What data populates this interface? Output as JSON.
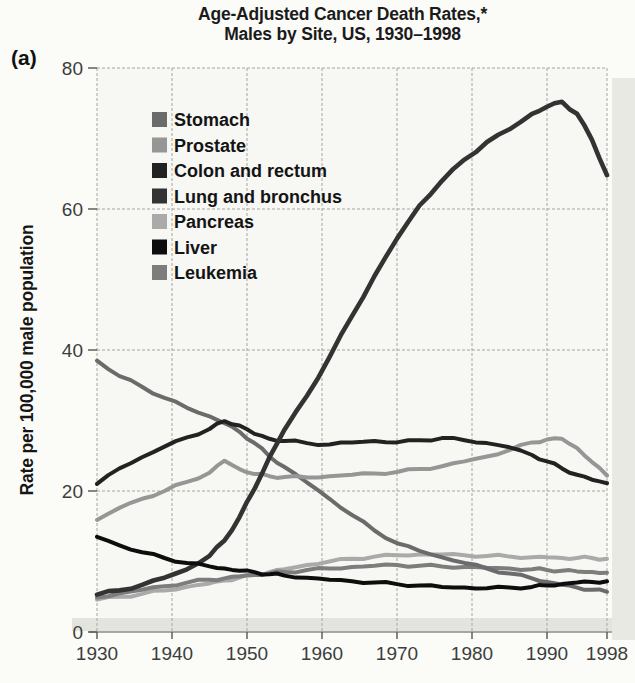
{
  "figure": {
    "panel_label": "(a)",
    "title_line1": "Age-Adjusted Cancer Death Rates,*",
    "title_line2": "Males by Site, US, 1930–1998",
    "y_axis_label": "Rate per 100,000 male population"
  },
  "colors": {
    "paper": "#fbfbf8",
    "plot_background": "#f7f7f3",
    "gridline": "#a5a5a0",
    "axis": "#555550",
    "tick_text": "#3d3d3d",
    "scan_shadow": "#e4e4df",
    "page_edge_band": "#e9e9e4"
  },
  "chart_data": {
    "type": "line",
    "title": "Age-Adjusted Cancer Death Rates,* Males by Site, US, 1930–1998",
    "xlabel": "",
    "ylabel": "Rate per 100,000 male population",
    "xlim": [
      1930,
      1998
    ],
    "ylim": [
      0,
      80
    ],
    "x_ticks": [
      1930,
      1940,
      1950,
      1960,
      1970,
      1980,
      1990,
      1998
    ],
    "x_tick_labels": [
      "1930",
      "1940",
      "1950",
      "1960",
      "1970",
      "1980",
      "1990",
      "1998"
    ],
    "y_ticks": [
      0,
      20,
      40,
      60,
      80
    ],
    "grid": true,
    "legend_position": "upper-left-inside",
    "x": [
      1930,
      1933,
      1936,
      1939,
      1942,
      1945,
      1947,
      1949,
      1951,
      1953,
      1955,
      1958,
      1961,
      1964,
      1967,
      1970,
      1973,
      1976,
      1979,
      1982,
      1985,
      1988,
      1990,
      1992,
      1994,
      1996,
      1998
    ],
    "series": [
      {
        "name": "Stomach",
        "color": "#6b6b6b",
        "values": [
          38.5,
          36.3,
          34.8,
          33.2,
          31.8,
          30.6,
          29.6,
          28.4,
          26.8,
          24.9,
          23.4,
          21.2,
          18.9,
          16.6,
          14.4,
          12.6,
          11.5,
          10.6,
          9.8,
          9.0,
          8.3,
          7.6,
          7.1,
          6.7,
          6.3,
          6.0,
          5.7
        ]
      },
      {
        "name": "Prostate",
        "color": "#969696",
        "values": [
          15.9,
          17.6,
          18.9,
          20.0,
          21.3,
          22.6,
          24.3,
          23.1,
          22.4,
          22.1,
          22.0,
          21.9,
          22.1,
          22.3,
          22.5,
          22.7,
          23.1,
          23.5,
          24.2,
          24.9,
          25.8,
          26.9,
          27.3,
          27.4,
          26.1,
          24.1,
          22.2
        ]
      },
      {
        "name": "Colon and rectum",
        "color": "#222222",
        "values": [
          21.0,
          23.2,
          24.8,
          26.3,
          27.6,
          28.8,
          29.9,
          29.3,
          28.1,
          27.4,
          27.1,
          26.8,
          26.6,
          26.9,
          27.1,
          26.9,
          27.2,
          27.5,
          27.2,
          26.8,
          26.2,
          25.1,
          24.2,
          23.2,
          22.3,
          21.6,
          21.1
        ]
      },
      {
        "name": "Lung and bronchus",
        "color": "#333333",
        "values": [
          5.3,
          5.9,
          6.7,
          7.7,
          8.9,
          10.8,
          13.0,
          16.3,
          20.3,
          24.8,
          28.7,
          33.5,
          39.0,
          44.8,
          50.5,
          55.8,
          60.5,
          64.0,
          67.0,
          69.5,
          71.3,
          73.5,
          74.5,
          75.2,
          73.5,
          69.8,
          64.8
        ]
      },
      {
        "name": "Pancreas",
        "color": "#aaaaaa",
        "values": [
          4.6,
          5.0,
          5.4,
          5.9,
          6.4,
          6.9,
          7.3,
          7.7,
          8.1,
          8.5,
          8.9,
          9.5,
          10.0,
          10.4,
          10.7,
          10.9,
          11.0,
          11.0,
          10.9,
          10.8,
          10.7,
          10.6,
          10.6,
          10.5,
          10.5,
          10.5,
          10.4
        ]
      },
      {
        "name": "Liver",
        "color": "#0d0d0d",
        "values": [
          13.5,
          12.3,
          11.3,
          10.5,
          9.8,
          9.3,
          9.0,
          8.7,
          8.5,
          8.2,
          8.0,
          7.7,
          7.4,
          7.2,
          7.0,
          6.8,
          6.6,
          6.4,
          6.3,
          6.2,
          6.3,
          6.4,
          6.6,
          6.8,
          7.0,
          7.1,
          7.2
        ]
      },
      {
        "name": "Leukemia",
        "color": "#7d7d7d",
        "values": [
          4.9,
          5.5,
          6.0,
          6.5,
          7.0,
          7.4,
          7.6,
          7.9,
          8.1,
          8.3,
          8.5,
          8.8,
          9.0,
          9.2,
          9.4,
          9.5,
          9.4,
          9.3,
          9.2,
          9.1,
          9.0,
          8.9,
          8.8,
          8.7,
          8.6,
          8.5,
          8.4
        ]
      }
    ]
  }
}
